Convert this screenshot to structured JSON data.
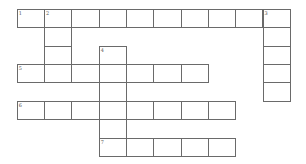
{
  "puzzle": {
    "type": "crossword",
    "colors": {
      "background": "#ffffff",
      "grid_line": "#6a6a6a",
      "number": "#555555"
    },
    "geometry": {
      "origin_x": 17.3,
      "origin_y": 9.3,
      "cell_width": 27.3,
      "cell_height": 18.4,
      "columns": 10,
      "rows": 8
    },
    "cells": [
      {
        "r": 0,
        "c": 0,
        "num": "1"
      },
      {
        "r": 0,
        "c": 1,
        "num": "2"
      },
      {
        "r": 0,
        "c": 2
      },
      {
        "r": 0,
        "c": 3
      },
      {
        "r": 0,
        "c": 4
      },
      {
        "r": 0,
        "c": 5
      },
      {
        "r": 0,
        "c": 6
      },
      {
        "r": 0,
        "c": 7
      },
      {
        "r": 0,
        "c": 8
      },
      {
        "r": 0,
        "c": 9,
        "num": "3"
      },
      {
        "r": 1,
        "c": 1
      },
      {
        "r": 1,
        "c": 9
      },
      {
        "r": 2,
        "c": 1
      },
      {
        "r": 2,
        "c": 3,
        "num": "4"
      },
      {
        "r": 2,
        "c": 9
      },
      {
        "r": 3,
        "c": 0,
        "num": "5"
      },
      {
        "r": 3,
        "c": 1
      },
      {
        "r": 3,
        "c": 2
      },
      {
        "r": 3,
        "c": 3
      },
      {
        "r": 3,
        "c": 4
      },
      {
        "r": 3,
        "c": 5
      },
      {
        "r": 3,
        "c": 6
      },
      {
        "r": 3,
        "c": 9
      },
      {
        "r": 4,
        "c": 3
      },
      {
        "r": 4,
        "c": 9
      },
      {
        "r": 5,
        "c": 0,
        "num": "6"
      },
      {
        "r": 5,
        "c": 1
      },
      {
        "r": 5,
        "c": 2
      },
      {
        "r": 5,
        "c": 3
      },
      {
        "r": 5,
        "c": 4
      },
      {
        "r": 5,
        "c": 5
      },
      {
        "r": 5,
        "c": 6
      },
      {
        "r": 5,
        "c": 7
      },
      {
        "r": 6,
        "c": 3
      },
      {
        "r": 7,
        "c": 3,
        "num": "7"
      },
      {
        "r": 7,
        "c": 4
      },
      {
        "r": 7,
        "c": 5
      },
      {
        "r": 7,
        "c": 6
      },
      {
        "r": 7,
        "c": 7
      }
    ],
    "entries": {
      "across": [
        {
          "num": "1",
          "row": 0,
          "col": 0,
          "length": 10
        },
        {
          "num": "5",
          "row": 3,
          "col": 0,
          "length": 7
        },
        {
          "num": "6",
          "row": 5,
          "col": 0,
          "length": 8
        },
        {
          "num": "7",
          "row": 7,
          "col": 3,
          "length": 5
        }
      ],
      "down": [
        {
          "num": "2",
          "row": 0,
          "col": 1,
          "length": 4
        },
        {
          "num": "3",
          "row": 0,
          "col": 9,
          "length": 5
        },
        {
          "num": "4",
          "row": 2,
          "col": 3,
          "length": 6
        }
      ]
    }
  }
}
